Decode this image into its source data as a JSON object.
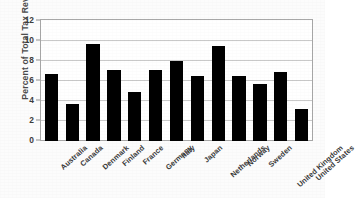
{
  "chart_data": {
    "type": "bar",
    "title": "",
    "xlabel": "",
    "ylabel": "Percent of Total Tax Revenue",
    "ylim": [
      0,
      12
    ],
    "yticks": [
      0,
      2,
      4,
      6,
      8,
      10,
      12
    ],
    "ytick_labels": [
      "0",
      "2",
      "4",
      "6",
      "8",
      "10",
      "12"
    ],
    "grid": "horizontal",
    "legend": "none",
    "bar_color": "#000000",
    "plot_background": "#ffffff",
    "frame_color": "#a8a8a8",
    "gridline_color": "#c9c9c9",
    "categories": [
      "Australia",
      "Canada",
      "Denmark",
      "Finland",
      "France",
      "Germany",
      "Italy",
      "Japan",
      "Netherlands",
      "Norway",
      "Sweden",
      "United Kingdom",
      "United States"
    ],
    "values": [
      6.6,
      3.7,
      9.6,
      7.0,
      4.9,
      7.0,
      7.9,
      6.4,
      9.4,
      6.4,
      5.7,
      6.8,
      3.2
    ]
  }
}
